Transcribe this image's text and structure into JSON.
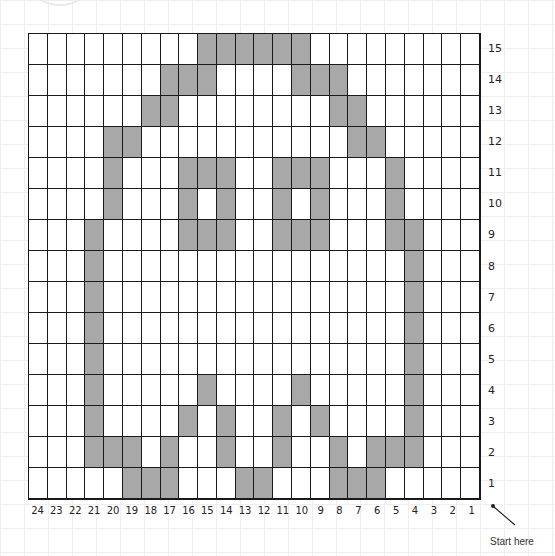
{
  "pattern": {
    "columns": 24,
    "rows": 15,
    "column_order": "right-to-left (1 at right, 24 at left)",
    "row_order": "bottom-to-top (1 at bottom, 15 at top)",
    "fill_color": "#a8a8a8",
    "line_color": "#1a1a1a",
    "filled_cells": {
      "15": [
        15,
        14,
        13,
        12,
        11,
        10
      ],
      "14": [
        17,
        16,
        15,
        10,
        9,
        8
      ],
      "13": [
        18,
        17,
        8,
        7
      ],
      "12": [
        20,
        19,
        7,
        6
      ],
      "11": [
        20,
        16,
        15,
        14,
        11,
        10,
        9,
        5
      ],
      "10": [
        20,
        16,
        14,
        11,
        9,
        5
      ],
      "9": [
        21,
        16,
        15,
        14,
        11,
        10,
        9,
        5,
        4
      ],
      "8": [
        21,
        4
      ],
      "7": [
        21,
        4
      ],
      "6": [
        21,
        4
      ],
      "5": [
        21,
        4
      ],
      "4": [
        21,
        15,
        10,
        4
      ],
      "3": [
        21,
        16,
        14,
        11,
        9,
        4
      ],
      "2": [
        21,
        20,
        19,
        17,
        14,
        11,
        8,
        6,
        5,
        4
      ],
      "1": [
        19,
        18,
        17,
        13,
        12,
        8,
        7,
        6
      ]
    }
  },
  "row_labels": [
    "15",
    "14",
    "13",
    "12",
    "11",
    "10",
    "9",
    "8",
    "7",
    "6",
    "5",
    "4",
    "3",
    "2",
    "1"
  ],
  "column_labels": [
    "24",
    "23",
    "22",
    "21",
    "20",
    "19",
    "18",
    "17",
    "16",
    "15",
    "14",
    "13",
    "12",
    "11",
    "10",
    "9",
    "8",
    "7",
    "6",
    "5",
    "4",
    "3",
    "2",
    "1"
  ],
  "start_note": "Start here"
}
